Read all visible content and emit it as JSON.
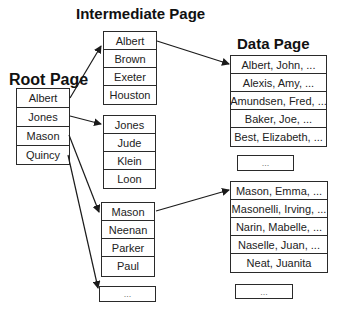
{
  "titles": {
    "root": "Root Page",
    "intermediate": "Intermediate Page",
    "data": "Data Page"
  },
  "root_page": {
    "rows": [
      "Albert",
      "Jones",
      "Mason",
      "Quincy"
    ]
  },
  "intermediate_pages": [
    {
      "rows": [
        "Albert",
        "Brown",
        "Exeter",
        "Houston"
      ]
    },
    {
      "rows": [
        "Jones",
        "Jude",
        "Klein",
        "Loon"
      ]
    },
    {
      "rows": [
        "Mason",
        "Neenan",
        "Parker",
        "Paul"
      ]
    }
  ],
  "intermediate_ellipsis": "...",
  "data_pages": [
    {
      "rows": [
        "Albert, John, ...",
        "Alexis, Amy, ...",
        "Amundsen, Fred, ...",
        "Baker, Joe, ...",
        "Best, Elizabeth, ..."
      ]
    },
    {
      "rows": [
        "Mason, Emma, ...",
        "Masonelli, Irving, ...",
        "Narin, Mabelle, ...",
        "Naselle, Juan, ...",
        "Neat, Juanita"
      ]
    }
  ],
  "data_ellipsis": [
    "...",
    "..."
  ],
  "colors": {
    "line": "#2a2a2a",
    "text": "#222222",
    "background": "#ffffff"
  }
}
